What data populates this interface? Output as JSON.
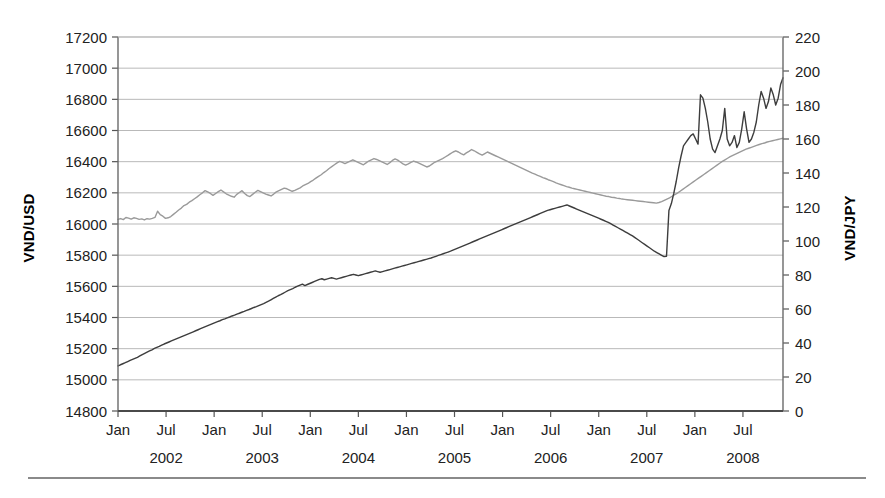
{
  "chart_data": {
    "type": "line",
    "title": "",
    "subtitle": "",
    "xlabel": "",
    "ylabel": "VND/USD",
    "y2label": "VND/JPY",
    "ylim": [
      14800,
      17200
    ],
    "ytick_step": 200,
    "y2lim": [
      0,
      220
    ],
    "y2tick_step": 20,
    "grid": true,
    "legend": "none",
    "x_tick_labels": [
      "Jan",
      "Jul",
      "Jan",
      "Jul",
      "Jan",
      "Jul",
      "Jan",
      "Jul",
      "Jan",
      "Jul",
      "Jan",
      "Jul",
      "Jan",
      "Jul"
    ],
    "year_labels": [
      "2002",
      "2003",
      "2004",
      "2005",
      "2006",
      "2007",
      "2008"
    ],
    "x_range_start": "2002-01",
    "x_range_end": "2008-12",
    "yticks": [
      "14800",
      "15000",
      "15200",
      "15400",
      "15600",
      "15800",
      "16000",
      "16200",
      "16400",
      "16600",
      "16800",
      "17000",
      "17200"
    ],
    "y2ticks": [
      "0",
      "20",
      "40",
      "60",
      "80",
      "100",
      "120",
      "140",
      "160",
      "180",
      "200",
      "220"
    ],
    "series": [
      {
        "name": "VND/USD",
        "axis": "left",
        "color": "#9a9a9a",
        "unit": "VND/USD",
        "values": [
          16030,
          16035,
          16028,
          16042,
          16038,
          16031,
          16040,
          16036,
          16030,
          16033,
          16026,
          16034,
          16031,
          16036,
          16042,
          16082,
          16060,
          16050,
          16036,
          16040,
          16048,
          16062,
          16075,
          16090,
          16102,
          16118,
          16126,
          16140,
          16150,
          16162,
          16174,
          16188,
          16200,
          16214,
          16206,
          16196,
          16184,
          16196,
          16208,
          16218,
          16206,
          16194,
          16186,
          16178,
          16172,
          16190,
          16202,
          16214,
          16196,
          16182,
          16176,
          16190,
          16204,
          16216,
          16208,
          16200,
          16192,
          16186,
          16180,
          16192,
          16206,
          16214,
          16222,
          16230,
          16226,
          16218,
          16210,
          16216,
          16224,
          16232,
          16244,
          16252,
          16260,
          16272,
          16282,
          16294,
          16306,
          16316,
          16330,
          16342,
          16356,
          16368,
          16380,
          16392,
          16402,
          16396,
          16388,
          16396,
          16404,
          16412,
          16404,
          16396,
          16388,
          16380,
          16392,
          16404,
          16412,
          16420,
          16414,
          16406,
          16398,
          16390,
          16382,
          16394,
          16408,
          16418,
          16410,
          16398,
          16386,
          16378,
          16386,
          16396,
          16404,
          16398,
          16390,
          16382,
          16374,
          16366,
          16372,
          16384,
          16396,
          16404,
          16412,
          16420,
          16430,
          16440,
          16452,
          16462,
          16470,
          16462,
          16452,
          16444,
          16456,
          16466,
          16478,
          16470,
          16460,
          16450,
          16442,
          16452,
          16462,
          16454,
          16446,
          16438,
          16430,
          16422,
          16414,
          16406,
          16398,
          16390,
          16382,
          16374,
          16366,
          16358,
          16350,
          16342,
          16334,
          16326,
          16320,
          16312,
          16306,
          16298,
          16292,
          16284,
          16278,
          16272,
          16264,
          16258,
          16252,
          16246,
          16240,
          16236,
          16230,
          16226,
          16222,
          16218,
          16214,
          16210,
          16206,
          16202,
          16198,
          16194,
          16190,
          16186,
          16182,
          16178,
          16176,
          16172,
          16170,
          16166,
          16164,
          16160,
          16158,
          16156,
          16154,
          16152,
          16150,
          16148,
          16146,
          16144,
          16142,
          16140,
          16138,
          16136,
          16134,
          16138,
          16144,
          16152,
          16160,
          16168,
          16178,
          16188,
          16198,
          16210,
          16222,
          16234,
          16246,
          16258,
          16270,
          16282,
          16294,
          16306,
          16318,
          16330,
          16342,
          16354,
          16366,
          16378,
          16390,
          16402,
          16412,
          16422,
          16432,
          16440,
          16448,
          16456,
          16464,
          16472,
          16480,
          16486,
          16492,
          16498,
          16504,
          16510,
          16516,
          16520,
          16526,
          16530,
          16534,
          16538,
          16542,
          16546,
          16550
        ]
      },
      {
        "name": "VND/JPY",
        "axis": "right",
        "color": "#3d3d3d",
        "unit": "VND/JPY",
        "values": [
          26.5,
          27.2,
          27.8,
          28.4,
          29.1,
          29.8,
          30.4,
          31.0,
          31.6,
          32.4,
          33.2,
          33.9,
          34.6,
          35.3,
          36.0,
          36.8,
          37.4,
          38.0,
          38.7,
          39.4,
          40.0,
          40.6,
          41.2,
          41.8,
          42.4,
          43.0,
          43.6,
          44.2,
          44.8,
          45.4,
          46.0,
          46.6,
          47.2,
          47.8,
          48.4,
          49.0,
          49.6,
          50.2,
          50.8,
          51.4,
          52.0,
          52.6,
          53.1,
          53.7,
          54.2,
          54.8,
          55.3,
          55.9,
          56.4,
          57.0,
          57.5,
          58.1,
          58.6,
          59.2,
          59.7,
          60.3,
          60.9,
          61.4,
          62.0,
          62.6,
          63.2,
          63.9,
          64.6,
          65.4,
          66.2,
          67.0,
          67.8,
          68.4,
          69.2,
          70.0,
          70.8,
          71.4,
          72.0,
          72.8,
          73.4,
          74.0,
          74.6,
          73.8,
          74.4,
          75.0,
          75.6,
          76.2,
          76.8,
          77.4,
          77.8,
          77.2,
          77.6,
          78.0,
          78.4,
          78.0,
          77.6,
          78.0,
          78.4,
          78.8,
          79.2,
          79.6,
          80.0,
          80.4,
          80.0,
          79.6,
          80.0,
          80.4,
          80.8,
          81.2,
          81.6,
          82.0,
          82.4,
          82.0,
          81.6,
          82.0,
          82.4,
          82.8,
          83.2,
          83.6,
          84.0,
          84.4,
          84.8,
          85.2,
          85.6,
          86.0,
          86.4,
          86.8,
          87.2,
          87.6,
          88.0,
          88.4,
          88.8,
          89.2,
          89.6,
          90.0,
          90.5,
          91.0,
          91.5,
          92.0,
          92.5,
          93.0,
          93.5,
          94.0,
          94.6,
          95.2,
          95.8,
          96.4,
          97.0,
          97.6,
          98.2,
          98.8,
          99.4,
          100.0,
          100.6,
          101.2,
          101.8,
          102.4,
          103.0,
          103.6,
          104.2,
          104.8,
          105.4,
          106.0,
          106.6,
          107.2,
          107.8,
          108.4,
          109.0,
          109.6,
          110.2,
          110.8,
          111.4,
          112.0,
          112.6,
          113.2,
          113.8,
          114.4,
          115.0,
          115.6,
          116.2,
          116.8,
          117.4,
          118.0,
          118.4,
          118.8,
          119.2,
          119.6,
          120.0,
          120.4,
          120.8,
          121.2,
          120.6,
          120.0,
          119.4,
          118.8,
          118.2,
          117.6,
          117.0,
          116.4,
          115.8,
          115.2,
          114.6,
          114.0,
          113.4,
          112.8,
          112.2,
          111.6,
          111.0,
          110.2,
          109.4,
          108.6,
          107.8,
          107.0,
          106.2,
          105.4,
          104.6,
          103.8,
          103.0,
          102.0,
          101.0,
          100.0,
          99.0,
          98.0,
          97.0,
          96.0,
          95.0,
          94.0,
          93.2,
          92.4,
          91.6,
          90.8,
          91.0,
          118.0,
          122.0,
          128.0,
          135.0,
          143.0,
          150.0,
          156.0,
          158.0,
          160.0,
          162.0,
          163.0,
          160.0,
          157.0,
          186.0,
          184.0,
          178.0,
          170.0,
          160.0,
          154.0,
          152.0,
          156.0,
          160.0,
          165.0,
          178.0,
          160.0,
          156.0,
          158.0,
          162.0,
          155.0,
          158.0,
          166.0,
          176.0,
          166.0,
          158.0,
          160.0,
          164.0,
          170.0,
          180.0,
          188.0,
          184.0,
          178.0,
          182.0,
          190.0,
          186.0,
          180.0,
          184.0,
          192.0,
          196.0
        ]
      }
    ]
  }
}
